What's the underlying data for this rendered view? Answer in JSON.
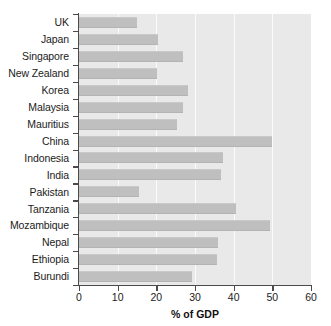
{
  "chart_data": {
    "type": "bar",
    "orientation": "horizontal",
    "title": "",
    "xlabel": "% of GDP",
    "ylabel": "",
    "xlim": [
      0,
      60
    ],
    "ylim": null,
    "grid": true,
    "legend": false,
    "xticks": [
      0,
      10,
      20,
      30,
      40,
      50,
      60
    ],
    "xtick_labels": [
      "0",
      "10",
      "20",
      "30",
      "40",
      "50",
      "60"
    ],
    "categories": [
      "UK",
      "Japan",
      "Singapore",
      "New Zealand",
      "Korea",
      "Malaysia",
      "Mauritius",
      "China",
      "Indonesia",
      "India",
      "Pakistan",
      "Tanzania",
      "Mozambique",
      "Nepal",
      "Ethiopia",
      "Burundi"
    ],
    "values": [
      15.0,
      20.4,
      26.9,
      20.2,
      28.2,
      26.9,
      25.3,
      49.9,
      37.2,
      36.7,
      15.5,
      40.6,
      49.4,
      35.9,
      35.7,
      29.2
    ],
    "bar_color": "#bfbfbf",
    "plot_background": "#e9e9e9",
    "gridline_color": "#fbfbfb",
    "axis_color": "#4a4a4a",
    "text_color": "#1b1b1b"
  }
}
